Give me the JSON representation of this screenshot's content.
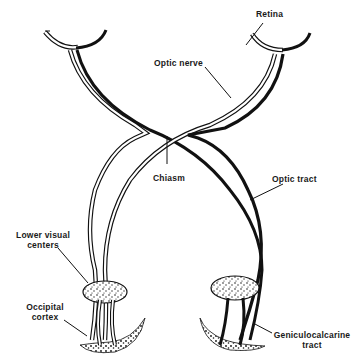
{
  "diagram": {
    "labels": {
      "retina": "Retina",
      "optic_nerve": "Optic nerve",
      "chiasm": "Chiasm",
      "optic_tract": "Optic tract",
      "lower_visual_centers_1": "Lower visual",
      "lower_visual_centers_2": "centers",
      "occipital_cortex_1": "Occipital",
      "occipital_cortex_2": "cortex",
      "geniculocalcarine_1": "Geniculocalcarine",
      "geniculocalcarine_2": "tract"
    },
    "colors": {
      "ink": "#111111",
      "background": "#ffffff"
    }
  }
}
